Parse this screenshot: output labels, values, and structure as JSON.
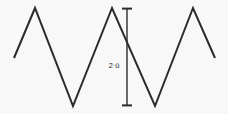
{
  "figure": {
    "background_color": "#f8f8f8",
    "line_color": "#2b2b2b",
    "label_color": "#1f1f1f",
    "width": 228,
    "height": 114
  },
  "chart_data": {
    "type": "line",
    "title": "",
    "subtitle": "",
    "xlabel": "",
    "ylabel": "",
    "grid": false,
    "legend": null,
    "axes_visible": false,
    "waveform_shape": "triangular",
    "periods_shown": 2,
    "stroke_width": 2,
    "xlim": [
      0,
      228
    ],
    "ylim": [
      0,
      114
    ],
    "note": "y values are in screen pixel coordinates (y increases downward); peak y=8, trough y=106, midline y=57",
    "peak_y": 8,
    "trough_y": 106,
    "midline_y": 57,
    "points": [
      {
        "x": 14,
        "y": 58,
        "kind": "start"
      },
      {
        "x": 35,
        "y": 8,
        "kind": "peak"
      },
      {
        "x": 73,
        "y": 106,
        "kind": "trough"
      },
      {
        "x": 112,
        "y": 8,
        "kind": "peak"
      },
      {
        "x": 155,
        "y": 106,
        "kind": "trough"
      },
      {
        "x": 193,
        "y": 8,
        "kind": "peak"
      },
      {
        "x": 215,
        "y": 58,
        "kind": "end"
      }
    ],
    "x": [
      14,
      35,
      73,
      112,
      155,
      193,
      215
    ],
    "values": [
      58,
      8,
      106,
      8,
      106,
      8,
      58
    ],
    "annotations": [
      {
        "name": "peak-to-peak-dimension",
        "text": "2·û",
        "type": "double-headed-arrow",
        "orientation": "vertical",
        "x": 127,
        "y_top": 8,
        "y_bottom": 106,
        "cap_half_width": 5,
        "label_x": 114,
        "label_y": 66,
        "font_size": 7
      }
    ]
  },
  "dimension": {
    "label": "2·û",
    "meaning": "peak-to-peak amplitude"
  }
}
